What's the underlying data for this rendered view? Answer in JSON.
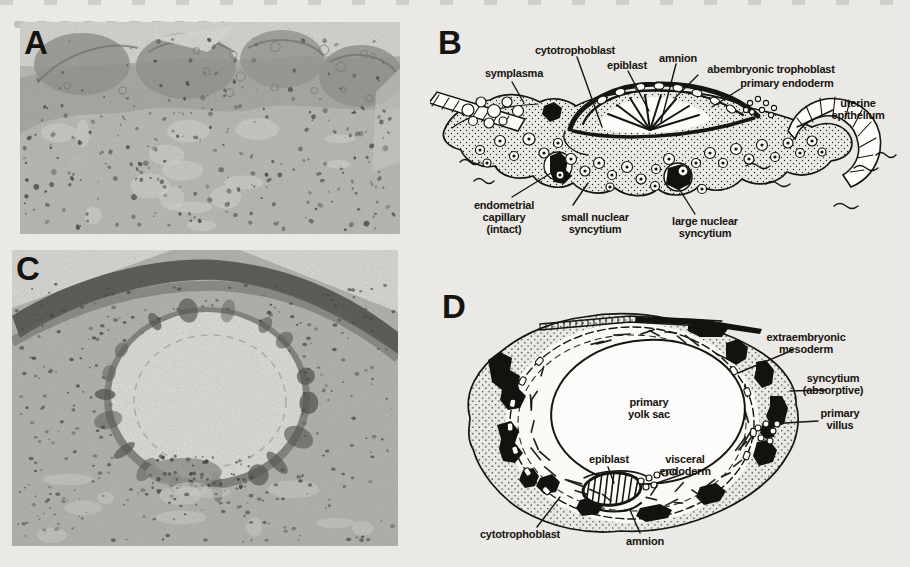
{
  "figure": {
    "ink_color": "#17140f",
    "paper_color": "#eae9e5",
    "panel_a": {
      "letter": "A",
      "type": "histology micrograph"
    },
    "panel_b": {
      "letter": "B",
      "type": "line drawing",
      "labels": {
        "symplasma": "symplasma",
        "cytotrophoblast": "cytotrophoblast",
        "epiblast": "epiblast",
        "amnion": "amnion",
        "abembryonic_trophoblast": "abembryonic trophoblast",
        "primary_endoderm": "primary endoderm",
        "uterine_epithelium": "uterine\nepithelium",
        "endometrial_capillary": "endometrial\ncapillary\n(intact)",
        "small_nuclear_syncytium": "small nuclear\nsyncytium",
        "large_nuclear_syncytium": "large nuclear\nsyncytium"
      }
    },
    "panel_c": {
      "letter": "C",
      "type": "histology micrograph"
    },
    "panel_d": {
      "letter": "D",
      "type": "line drawing",
      "labels": {
        "extraembryonic_mesoderm": "extraembryonic\nmesoderm",
        "syncytium_absorptive": "syncytium\n(absorptive)",
        "primary_villus": "primary\nvillus",
        "primary_yolk_sac": "primary\nyolk sac",
        "epiblast": "epiblast",
        "visceral_endoderm": "visceral\nendoderm",
        "cytotrophoblast": "cytotrophoblast",
        "amnion": "amnion"
      }
    }
  }
}
